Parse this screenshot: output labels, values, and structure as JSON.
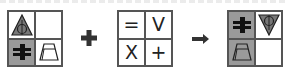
{
  "puzzle": {
    "operator_plus": "+",
    "operator_arrow": "→",
    "left_grid": {
      "cells": [
        {
          "pos": "top-left",
          "icon": "triangle-circle-icon",
          "shaded": false
        },
        {
          "pos": "top-right",
          "icon": "empty",
          "shaded": false
        },
        {
          "pos": "bottom-left",
          "icon": "not-equal-blob-icon",
          "shaded": true
        },
        {
          "pos": "bottom-right",
          "icon": "trapezoid-icon",
          "shaded": false
        }
      ]
    },
    "rule_grid": {
      "cells": [
        {
          "pos": "top-left",
          "symbol": "="
        },
        {
          "pos": "top-right",
          "symbol": "V"
        },
        {
          "pos": "bottom-left",
          "symbol": "X"
        },
        {
          "pos": "bottom-right",
          "symbol": "+"
        }
      ]
    },
    "result_grid": {
      "cells": [
        {
          "pos": "top-left",
          "icon": "not-equal-blob-icon",
          "shaded": true
        },
        {
          "pos": "top-right",
          "icon": "inverted-triangle-circle-icon",
          "shaded": false
        },
        {
          "pos": "bottom-left",
          "icon": "trapezoid-icon",
          "shaded": true
        },
        {
          "pos": "bottom-right",
          "icon": "empty",
          "shaded": false
        }
      ]
    },
    "colors": {
      "shade": "#9a9a9a",
      "line": "#555555",
      "ink": "#222222"
    }
  }
}
